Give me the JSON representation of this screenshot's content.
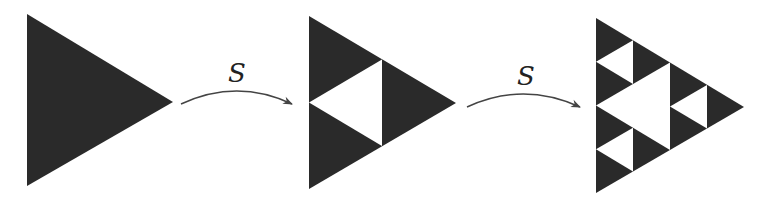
{
  "diagram": {
    "colors": {
      "fill": "#2a2a2a",
      "hole": "#ffffff",
      "arrow": "#444444",
      "background": "#ffffff"
    },
    "stages": [
      {
        "name": "stage-0",
        "iteration": 0
      },
      {
        "name": "stage-1",
        "iteration": 1
      },
      {
        "name": "stage-2",
        "iteration": 2
      }
    ],
    "arrows": [
      {
        "label": "S"
      },
      {
        "label": "S"
      }
    ]
  }
}
